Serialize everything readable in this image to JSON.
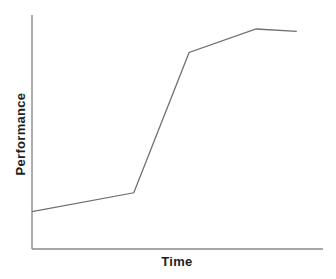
{
  "figure": {
    "background": "#ffffff",
    "axis_color": "#8a8a8a",
    "line_color": "#707070",
    "text_color": "#1e1e1e"
  },
  "chart_data": {
    "type": "line",
    "title": "",
    "xlabel": "Time",
    "ylabel": "Performance",
    "x_axis": {
      "range": [
        0,
        1
      ],
      "tick_labels": [],
      "ticks_visible": false
    },
    "y_axis": {
      "range": [
        0,
        1
      ],
      "tick_labels": [],
      "ticks_visible": false
    },
    "grid": false,
    "legend": "none",
    "series": [
      {
        "name": "performance-curve",
        "points": [
          {
            "x": 0.0,
            "y": 0.16
          },
          {
            "x": 0.35,
            "y": 0.24
          },
          {
            "x": 0.54,
            "y": 0.84
          },
          {
            "x": 0.77,
            "y": 0.94
          },
          {
            "x": 0.91,
            "y": 0.93
          }
        ]
      }
    ]
  }
}
